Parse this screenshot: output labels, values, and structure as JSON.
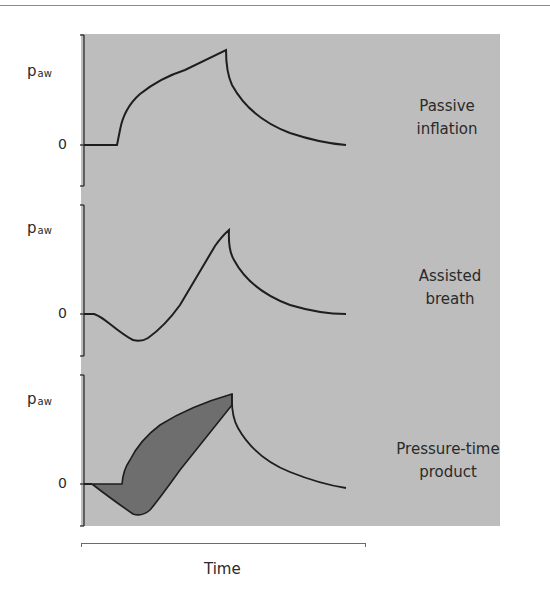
{
  "figure": {
    "x_axis_label": "Time",
    "panels": [
      {
        "id": "passive",
        "y_label_main": "p",
        "y_label_sub": "aw",
        "zero_label": "0",
        "caption_line1": "Passive",
        "caption_line2": "inflation"
      },
      {
        "id": "assisted",
        "y_label_main": "p",
        "y_label_sub": "aw",
        "zero_label": "0",
        "caption_line1": "Assisted",
        "caption_line2": "breath"
      },
      {
        "id": "ptp",
        "y_label_main": "p",
        "y_label_sub": "aw",
        "zero_label": "0",
        "caption_line1": "Pressure-time",
        "caption_line2": "product"
      }
    ],
    "colors": {
      "panel_background": "#bdbdbd",
      "curve": "#1e1e1e",
      "shaded_area": "#6e6e6e",
      "text": "#2a2a2a"
    }
  }
}
